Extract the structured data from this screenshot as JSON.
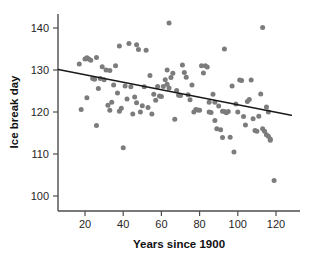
{
  "chart_data": {
    "type": "scatter",
    "title": "",
    "xlabel": "Years since 1900",
    "ylabel": "Ice break day",
    "xlim": [
      5,
      130
    ],
    "ylim": [
      96,
      143
    ],
    "xticks": [
      20,
      40,
      60,
      80,
      100,
      120
    ],
    "yticks": [
      100,
      110,
      120,
      130,
      140
    ],
    "xtick_labels": [
      "20",
      "40",
      "60",
      "80",
      "100",
      "120"
    ],
    "ytick_labels": [
      "100",
      "110",
      "120",
      "130",
      "140"
    ],
    "grid": false,
    "legend": null,
    "point_color": "#7c7c7c",
    "line_color": "#1a1a1a",
    "axis_color": "#4d4d4d",
    "background": "#ffffff",
    "trendline": {
      "name": "linear fit",
      "x": [
        6,
        128
      ],
      "y": [
        130.1,
        119.2
      ],
      "slope": -0.0893,
      "intercept": 130.6
    },
    "series": [
      {
        "name": "Ice break day observations",
        "points": [
          [
            17,
            131.4
          ],
          [
            18,
            120.6
          ],
          [
            20,
            132.6
          ],
          [
            21,
            132.9
          ],
          [
            21,
            123.4
          ],
          [
            22,
            132.6
          ],
          [
            23,
            132.3
          ],
          [
            24,
            128.0
          ],
          [
            25,
            127.8
          ],
          [
            26,
            133.0
          ],
          [
            26,
            116.8
          ],
          [
            27,
            125.6
          ],
          [
            28,
            128.0
          ],
          [
            29,
            130.8
          ],
          [
            30,
            127.7
          ],
          [
            31,
            130.0
          ],
          [
            32,
            121.6
          ],
          [
            33,
            120.4
          ],
          [
            33,
            129.9
          ],
          [
            34,
            122.3
          ],
          [
            35,
            126.4
          ],
          [
            36,
            131.0
          ],
          [
            37,
            124.5
          ],
          [
            38,
            120.2
          ],
          [
            38,
            135.7
          ],
          [
            39,
            120.9
          ],
          [
            40,
            111.5
          ],
          [
            41,
            126.2
          ],
          [
            42,
            123.1
          ],
          [
            43,
            136.3
          ],
          [
            44,
            126.0
          ],
          [
            45,
            119.5
          ],
          [
            46,
            123.6
          ],
          [
            47,
            136.0
          ],
          [
            47,
            122.2
          ],
          [
            48,
            134.9
          ],
          [
            49,
            120.0
          ],
          [
            50,
            121.5
          ],
          [
            51,
            126.0
          ],
          [
            52,
            134.7
          ],
          [
            53,
            121.1
          ],
          [
            54,
            128.7
          ],
          [
            55,
            119.5
          ],
          [
            56,
            124.2
          ],
          [
            57,
            122.8
          ],
          [
            58,
            126.1
          ],
          [
            59,
            123.8
          ],
          [
            60,
            123.7
          ],
          [
            61,
            126.1
          ],
          [
            62,
            127.7
          ],
          [
            63,
            130.0
          ],
          [
            63,
            126.6
          ],
          [
            64,
            141.2
          ],
          [
            64,
            125.7
          ],
          [
            65,
            128.2
          ],
          [
            66,
            129.2
          ],
          [
            67,
            118.3
          ],
          [
            68,
            125.1
          ],
          [
            69,
            124.0
          ],
          [
            70,
            123.9
          ],
          [
            71,
            131.2
          ],
          [
            72,
            129.4
          ],
          [
            73,
            128.3
          ],
          [
            74,
            124.1
          ],
          [
            75,
            122.9
          ],
          [
            76,
            126.4
          ],
          [
            77,
            120.0
          ],
          [
            78,
            120.6
          ],
          [
            79,
            120.5
          ],
          [
            80,
            120.4
          ],
          [
            81,
            131.0
          ],
          [
            82,
            129.3
          ],
          [
            83,
            131.0
          ],
          [
            84,
            130.7
          ],
          [
            85,
            122.3
          ],
          [
            85,
            120.0
          ],
          [
            86,
            119.9
          ],
          [
            87,
            124.2
          ],
          [
            88,
            118.0
          ],
          [
            88,
            122.3
          ],
          [
            89,
            116.0
          ],
          [
            90,
            121.4
          ],
          [
            91,
            115.8
          ],
          [
            92,
            113.9
          ],
          [
            92,
            120.2
          ],
          [
            93,
            135.0
          ],
          [
            93,
            120.1
          ],
          [
            94,
            119.8
          ],
          [
            95,
            120.1
          ],
          [
            96,
            114.0
          ],
          [
            97,
            126.2
          ],
          [
            98,
            110.5
          ],
          [
            99,
            121.9
          ],
          [
            100,
            120.0
          ],
          [
            101,
            127.6
          ],
          [
            102,
            127.5
          ],
          [
            103,
            118.9
          ],
          [
            104,
            116.9
          ],
          [
            105,
            122.5
          ],
          [
            106,
            123.0
          ],
          [
            107,
            127.6
          ],
          [
            108,
            118.4
          ],
          [
            109,
            115.6
          ],
          [
            110,
            115.4
          ],
          [
            111,
            119.0
          ],
          [
            112,
            124.3
          ],
          [
            113,
            116.0
          ],
          [
            113,
            140.1
          ],
          [
            114,
            115.4
          ],
          [
            115,
            114.6
          ],
          [
            115,
            121.2
          ],
          [
            116,
            120.0
          ],
          [
            116,
            114.2
          ],
          [
            117,
            113.6
          ],
          [
            117,
            113.3
          ],
          [
            119,
            103.7
          ]
        ]
      }
    ]
  }
}
